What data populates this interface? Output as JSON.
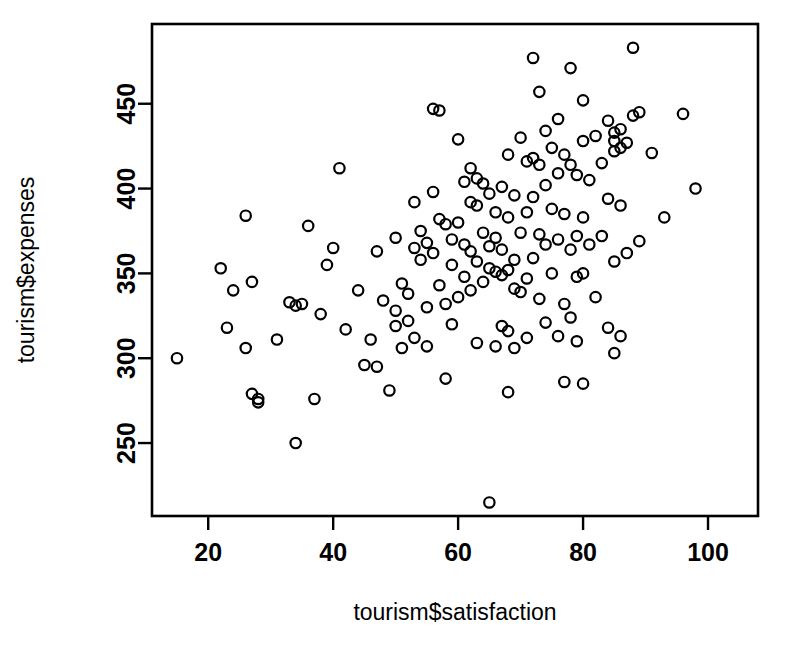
{
  "chart_data": {
    "type": "scatter",
    "title": "",
    "xlabel": "tourism$satisfaction",
    "ylabel": "tourism$expenses",
    "xlim": [
      11,
      108
    ],
    "ylim": [
      207,
      497
    ],
    "xticks": [
      20,
      40,
      60,
      80,
      100
    ],
    "xtick_labels": [
      "20",
      "40",
      "60",
      "80",
      "100"
    ],
    "yticks": [
      250,
      300,
      350,
      400,
      450
    ],
    "ytick_labels": [
      "250",
      "300",
      "350",
      "400",
      "450"
    ],
    "grid": false,
    "legend": null,
    "marker": "open-circle",
    "marker_color": "#000000",
    "n_points": 160,
    "points": [
      [
        15,
        300
      ],
      [
        22,
        353
      ],
      [
        23,
        318
      ],
      [
        24,
        340
      ],
      [
        26,
        384
      ],
      [
        26,
        306
      ],
      [
        27,
        345
      ],
      [
        27,
        279
      ],
      [
        28,
        276
      ],
      [
        28,
        274
      ],
      [
        31,
        311
      ],
      [
        33,
        333
      ],
      [
        34,
        250
      ],
      [
        34,
        331
      ],
      [
        35,
        332
      ],
      [
        36,
        378
      ],
      [
        37,
        276
      ],
      [
        38,
        326
      ],
      [
        39,
        355
      ],
      [
        40,
        365
      ],
      [
        41,
        412
      ],
      [
        42,
        317
      ],
      [
        44,
        340
      ],
      [
        45,
        296
      ],
      [
        46,
        311
      ],
      [
        47,
        363
      ],
      [
        47,
        295
      ],
      [
        48,
        334
      ],
      [
        49,
        281
      ],
      [
        50,
        371
      ],
      [
        50,
        328
      ],
      [
        50,
        319
      ],
      [
        51,
        344
      ],
      [
        51,
        306
      ],
      [
        52,
        338
      ],
      [
        52,
        322
      ],
      [
        53,
        392
      ],
      [
        53,
        365
      ],
      [
        53,
        312
      ],
      [
        54,
        375
      ],
      [
        54,
        358
      ],
      [
        55,
        368
      ],
      [
        55,
        330
      ],
      [
        55,
        307
      ],
      [
        56,
        447
      ],
      [
        56,
        398
      ],
      [
        56,
        362
      ],
      [
        57,
        446
      ],
      [
        57,
        382
      ],
      [
        57,
        343
      ],
      [
        58,
        379
      ],
      [
        58,
        332
      ],
      [
        58,
        288
      ],
      [
        59,
        370
      ],
      [
        59,
        355
      ],
      [
        59,
        320
      ],
      [
        60,
        429
      ],
      [
        60,
        380
      ],
      [
        60,
        336
      ],
      [
        61,
        404
      ],
      [
        61,
        367
      ],
      [
        61,
        348
      ],
      [
        62,
        412
      ],
      [
        62,
        392
      ],
      [
        62,
        363
      ],
      [
        62,
        340
      ],
      [
        63,
        406
      ],
      [
        63,
        390
      ],
      [
        63,
        357
      ],
      [
        63,
        309
      ],
      [
        64,
        403
      ],
      [
        64,
        374
      ],
      [
        64,
        345
      ],
      [
        65,
        397
      ],
      [
        65,
        366
      ],
      [
        65,
        353
      ],
      [
        65,
        215
      ],
      [
        66,
        386
      ],
      [
        66,
        371
      ],
      [
        66,
        351
      ],
      [
        66,
        307
      ],
      [
        67,
        401
      ],
      [
        67,
        364
      ],
      [
        67,
        349
      ],
      [
        67,
        319
      ],
      [
        68,
        420
      ],
      [
        68,
        383
      ],
      [
        68,
        352
      ],
      [
        68,
        316
      ],
      [
        68,
        280
      ],
      [
        69,
        396
      ],
      [
        69,
        358
      ],
      [
        69,
        341
      ],
      [
        69,
        306
      ],
      [
        70,
        430
      ],
      [
        70,
        374
      ],
      [
        70,
        339
      ],
      [
        71,
        416
      ],
      [
        71,
        386
      ],
      [
        71,
        347
      ],
      [
        71,
        312
      ],
      [
        72,
        477
      ],
      [
        72,
        418
      ],
      [
        72,
        395
      ],
      [
        72,
        359
      ],
      [
        73,
        457
      ],
      [
        73,
        414
      ],
      [
        73,
        373
      ],
      [
        73,
        335
      ],
      [
        74,
        434
      ],
      [
        74,
        402
      ],
      [
        74,
        367
      ],
      [
        74,
        321
      ],
      [
        75,
        424
      ],
      [
        75,
        388
      ],
      [
        75,
        350
      ],
      [
        76,
        441
      ],
      [
        76,
        409
      ],
      [
        76,
        370
      ],
      [
        76,
        313
      ],
      [
        77,
        420
      ],
      [
        77,
        385
      ],
      [
        77,
        332
      ],
      [
        77,
        286
      ],
      [
        78,
        471
      ],
      [
        78,
        414
      ],
      [
        78,
        364
      ],
      [
        78,
        324
      ],
      [
        79,
        408
      ],
      [
        79,
        372
      ],
      [
        79,
        348
      ],
      [
        79,
        310
      ],
      [
        80,
        452
      ],
      [
        80,
        428
      ],
      [
        80,
        383
      ],
      [
        80,
        350
      ],
      [
        80,
        285
      ],
      [
        81,
        405
      ],
      [
        81,
        367
      ],
      [
        82,
        431
      ],
      [
        82,
        336
      ],
      [
        83,
        415
      ],
      [
        83,
        372
      ],
      [
        84,
        440
      ],
      [
        84,
        394
      ],
      [
        84,
        318
      ],
      [
        85,
        433
      ],
      [
        85,
        428
      ],
      [
        85,
        422
      ],
      [
        85,
        357
      ],
      [
        85,
        303
      ],
      [
        86,
        435
      ],
      [
        86,
        424
      ],
      [
        86,
        390
      ],
      [
        86,
        313
      ],
      [
        87,
        427
      ],
      [
        87,
        362
      ],
      [
        88,
        483
      ],
      [
        88,
        443
      ],
      [
        89,
        445
      ],
      [
        89,
        369
      ],
      [
        91,
        421
      ],
      [
        93,
        383
      ],
      [
        96,
        444
      ],
      [
        98,
        400
      ]
    ]
  }
}
